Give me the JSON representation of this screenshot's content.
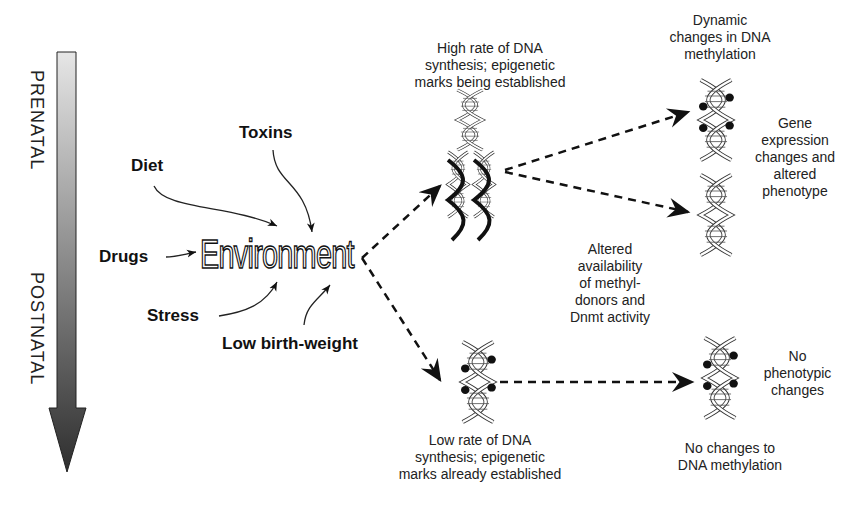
{
  "timeline": {
    "top_label": "PRENATAL",
    "bottom_label": "POSTNATAL",
    "gradient_start": "#e0e0e0",
    "gradient_end": "#333333"
  },
  "factors": {
    "diet": "Diet",
    "toxins": "Toxins",
    "drugs": "Drugs",
    "stress": "Stress",
    "low_birth_weight": "Low birth-weight"
  },
  "center": {
    "label": "Environment"
  },
  "nodes": {
    "high_rate": {
      "label_lines": [
        "High rate of DNA",
        "synthesis; epigenetic",
        "marks being established"
      ]
    },
    "low_rate": {
      "label_lines": [
        "Low rate of DNA",
        "synthesis; epigenetic",
        "marks already established"
      ]
    },
    "dynamic": {
      "label_lines": [
        "Dynamic",
        "changes in DNA",
        "methylation"
      ]
    },
    "gene_expression": {
      "label_lines": [
        "Gene",
        "expression",
        "changes and",
        "altered",
        "phenotype"
      ]
    },
    "altered_availability": {
      "label_lines": [
        "Altered",
        "availability",
        "of methyl-",
        "donors and",
        "Dnmt activity"
      ]
    },
    "no_phenotypic": {
      "label_lines": [
        "No",
        "phenotypic",
        "changes"
      ]
    },
    "no_changes": {
      "label_lines": [
        "No changes to",
        "DNA methylation"
      ]
    }
  }
}
